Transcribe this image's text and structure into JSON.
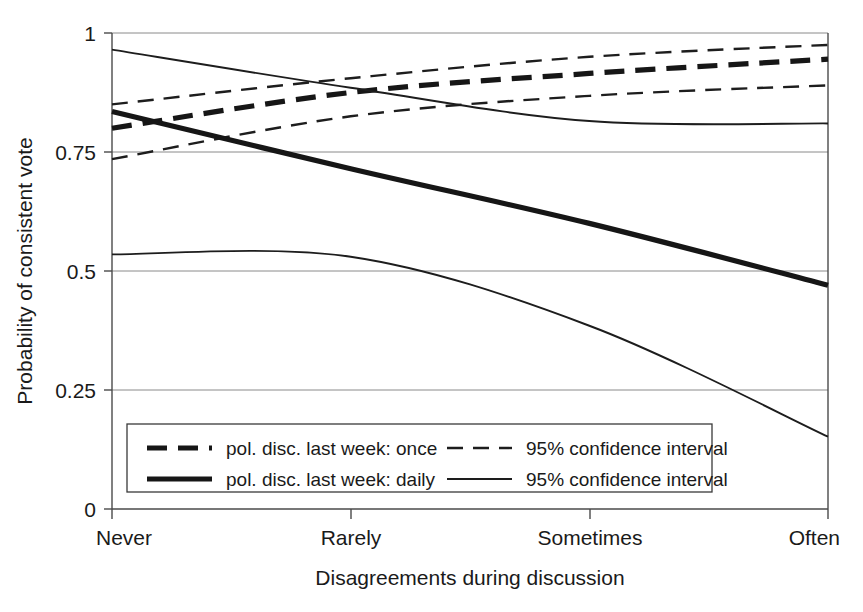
{
  "chart_data": {
    "type": "line",
    "title": "",
    "xlabel": "Disagreements during discussion",
    "ylabel": "Probability of consistent vote",
    "categories": [
      "Never",
      "Rarely",
      "Sometimes",
      "Often"
    ],
    "x": [
      0,
      1,
      2,
      3
    ],
    "ylim": [
      0,
      1
    ],
    "xlim": [
      0,
      3
    ],
    "yticks": [
      0,
      0.25,
      0.5,
      0.75,
      1
    ],
    "ytick_labels": [
      "0",
      "0.25",
      "0.5",
      "0.75",
      "1"
    ],
    "grid": "horizontal",
    "legend_position": "inside-bottom-left",
    "series": [
      {
        "name": "pol. disc. last week: once",
        "style": "thick-dashed",
        "values": [
          0.8,
          0.875,
          0.915,
          0.945
        ]
      },
      {
        "name": "95% confidence interval",
        "style": "thin-dashed",
        "role": "upper-bound-once",
        "values": [
          0.85,
          0.905,
          0.95,
          0.975
        ]
      },
      {
        "name": "95% confidence interval",
        "style": "thin-dashed",
        "role": "lower-bound-once",
        "values": [
          0.735,
          0.825,
          0.868,
          0.89
        ]
      },
      {
        "name": "pol. disc. last week: daily",
        "style": "thick-solid",
        "values": [
          0.835,
          0.715,
          0.6,
          0.47
        ]
      },
      {
        "name": "95% confidence interval",
        "style": "thin-solid",
        "role": "upper-bound-daily",
        "values": [
          0.965,
          0.885,
          0.815,
          0.81
        ]
      },
      {
        "name": "95% confidence interval",
        "style": "thin-solid",
        "role": "lower-bound-daily",
        "values": [
          0.535,
          0.53,
          0.385,
          0.152
        ]
      }
    ]
  },
  "axes": {
    "ylabel": "Probability of consistent vote",
    "xlabel": "Disagreements during discussion",
    "ytick_0": "0",
    "ytick_1": "0.25",
    "ytick_2": "0.5",
    "ytick_3": "0.75",
    "ytick_4": "1",
    "xtick_0": "Never",
    "xtick_1": "Rarely",
    "xtick_2": "Sometimes",
    "xtick_3": "Often"
  },
  "legend": {
    "entries": [
      {
        "label": "pol. disc. last week: once",
        "style": "thick-dashed"
      },
      {
        "label": "95% confidence interval",
        "style": "thin-dashed"
      },
      {
        "label": "pol. disc. last week: daily",
        "style": "thick-solid"
      },
      {
        "label": "95% confidence interval",
        "style": "thin-solid"
      }
    ]
  },
  "colors": {
    "line": "#161616",
    "grid": "#8a8a8a",
    "axis": "#4a4a4a",
    "background": "#ffffff"
  }
}
